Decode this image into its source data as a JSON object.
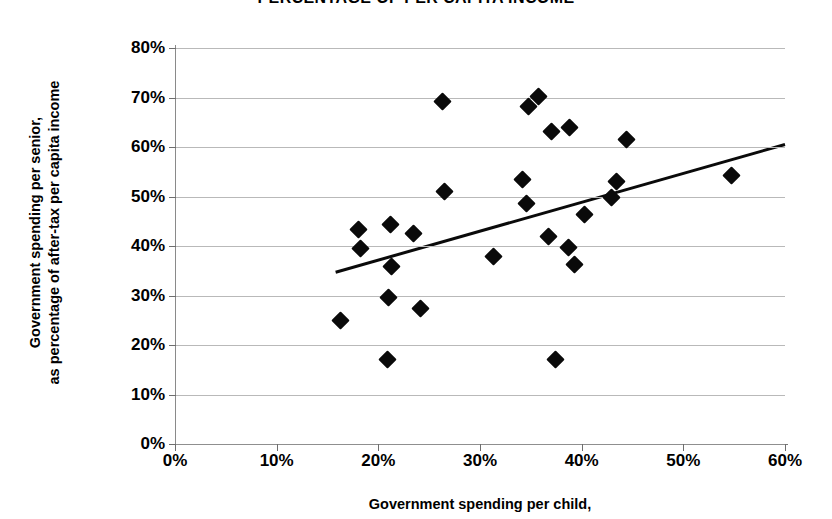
{
  "chart_data": {
    "type": "scatter",
    "title": "PERCENTAGE OF PER CAPITA INCOME",
    "xlabel": "Government spending per child,",
    "ylabel_line1": "Government spending per senior,",
    "ylabel_line2": "as percentage of after-tax per capita income",
    "xlim": [
      0,
      60
    ],
    "ylim": [
      0,
      80
    ],
    "x_ticks": [
      "0%",
      "10%",
      "20%",
      "30%",
      "40%",
      "50%",
      "60%"
    ],
    "y_ticks": [
      "0%",
      "10%",
      "20%",
      "30%",
      "40%",
      "50%",
      "60%",
      "70%",
      "80%"
    ],
    "x_tick_values": [
      0,
      10,
      20,
      30,
      40,
      50,
      60
    ],
    "y_tick_values": [
      0,
      10,
      20,
      30,
      40,
      50,
      60,
      70,
      80
    ],
    "grid": true,
    "legend": "none",
    "marker": "filled-diamond",
    "marker_color": "#0a0a0a",
    "gridline_color": "#b9b9b9",
    "points": [
      {
        "x": 16.3,
        "y": 24.9
      },
      {
        "x": 18.0,
        "y": 43.3
      },
      {
        "x": 18.2,
        "y": 39.4
      },
      {
        "x": 20.9,
        "y": 17.1
      },
      {
        "x": 21.0,
        "y": 29.5
      },
      {
        "x": 21.2,
        "y": 44.4
      },
      {
        "x": 21.3,
        "y": 35.8
      },
      {
        "x": 23.5,
        "y": 42.6
      },
      {
        "x": 24.1,
        "y": 27.4
      },
      {
        "x": 26.3,
        "y": 69.1
      },
      {
        "x": 26.5,
        "y": 51.0
      },
      {
        "x": 31.3,
        "y": 37.9
      },
      {
        "x": 34.2,
        "y": 53.5
      },
      {
        "x": 34.6,
        "y": 48.6
      },
      {
        "x": 34.8,
        "y": 68.2
      },
      {
        "x": 35.8,
        "y": 70.2
      },
      {
        "x": 36.7,
        "y": 42.0
      },
      {
        "x": 37.0,
        "y": 63.2
      },
      {
        "x": 37.4,
        "y": 17.1
      },
      {
        "x": 38.7,
        "y": 39.7
      },
      {
        "x": 38.8,
        "y": 63.9
      },
      {
        "x": 39.3,
        "y": 36.2
      },
      {
        "x": 40.3,
        "y": 46.4
      },
      {
        "x": 42.9,
        "y": 49.8
      },
      {
        "x": 43.4,
        "y": 53.1
      },
      {
        "x": 44.4,
        "y": 61.6
      },
      {
        "x": 54.7,
        "y": 54.2
      }
    ],
    "trendline": {
      "x_start": 15.8,
      "y_start": 34.7,
      "x_end": 60.0,
      "y_end": 60.5,
      "color": "#0a0a0a",
      "width": 3
    }
  }
}
